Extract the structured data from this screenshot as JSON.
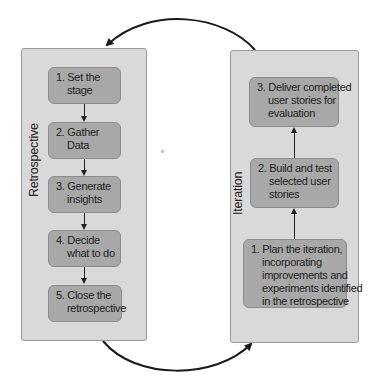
{
  "diagram": {
    "retrospective": {
      "label": "Retrospective",
      "steps": [
        {
          "line1": "1. Set the",
          "line2": "stage"
        },
        {
          "line1": "2. Gather",
          "line2": "Data"
        },
        {
          "line1": "3. Generate",
          "line2": "insights"
        },
        {
          "line1": "4. Decide",
          "line2": "what to do"
        },
        {
          "line1": "5. Close the",
          "line2": "retrospective"
        }
      ]
    },
    "iteration": {
      "label": "Iteration",
      "steps": [
        {
          "lines": [
            "1. Plan the iteration,",
            "incorporating",
            "improvements and",
            "experiments identified",
            "in the retrospective"
          ]
        },
        {
          "lines": [
            "2. Build and test",
            "selected user",
            "stories"
          ]
        },
        {
          "lines": [
            "3. Deliver completed",
            "user stories for",
            "evaluation"
          ]
        }
      ]
    },
    "colors": {
      "panel_fill": "#d9d9d9",
      "box_fill": "#a8a8a8",
      "arrow": "#1a1a1a"
    }
  }
}
